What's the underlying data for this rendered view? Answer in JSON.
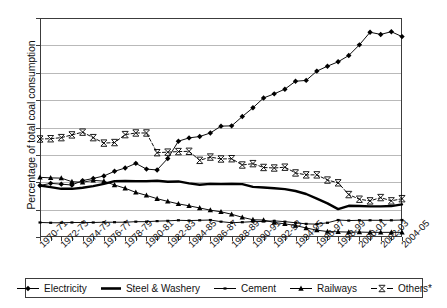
{
  "chart_data": {
    "type": "line",
    "title": "",
    "xlabel": "",
    "ylabel": "Percentage of total coal consumption",
    "ylim": [
      0,
      80
    ],
    "ytick_step": 10,
    "yticks": [
      "0",
      "10",
      "20",
      "30",
      "40",
      "50",
      "60",
      "70",
      "80"
    ],
    "grid": true,
    "legend_position": "bottom",
    "x": [
      "1970-71",
      "1971-72",
      "1972-73",
      "1973-74",
      "1974-75",
      "1975-76",
      "1976-77",
      "1977-78",
      "1978-79",
      "1979-80",
      "1980-81",
      "1981-82",
      "1982-83",
      "1983-84",
      "1984-85",
      "1985-86",
      "1986-87",
      "1987-88",
      "1988-89",
      "1989-90",
      "1990-91",
      "1991-92",
      "1992-93",
      "1993-94",
      "1994-95",
      "1995-96",
      "1996-97",
      "1997-98",
      "1998-99",
      "1999-00",
      "2000-01",
      "2001-02",
      "2002-03",
      "2003-04",
      "2004-05"
    ],
    "xtick_labels": [
      "1970-71",
      "1972-73",
      "1974-75",
      "1976-77",
      "1978-79",
      "1980-81",
      "1982-83",
      "1984-85",
      "1986-87",
      "1988-89",
      "1990-91",
      "1992-93",
      "1994-95",
      "1996-97",
      "1998-99",
      "2000-01",
      "2002-03",
      "2004-05"
    ],
    "series": [
      {
        "name": "Electricity",
        "marker": "diamond",
        "linestyle": "solid",
        "color": "#000000",
        "values": [
          18.8,
          19.6,
          19.3,
          19.0,
          20.6,
          21.4,
          22.3,
          24.0,
          25.2,
          26.9,
          24.8,
          24.5,
          28.7,
          35.0,
          36.2,
          36.7,
          38.0,
          40.5,
          40.6,
          44.0,
          47.2,
          50.8,
          52.3,
          54.0,
          56.9,
          57.2,
          60.6,
          62.4,
          64.0,
          66.3,
          70.2,
          74.8,
          74.0,
          75.0,
          73.2
        ]
      },
      {
        "name": "Steel & Washery",
        "marker": "none",
        "linestyle": "thick-solid",
        "color": "#000000",
        "values": [
          18.8,
          18.2,
          17.6,
          17.6,
          18.0,
          18.6,
          19.4,
          20.4,
          20.5,
          20.4,
          20.4,
          20.6,
          20.2,
          20.3,
          19.6,
          19.1,
          19.4,
          19.3,
          19.4,
          19.3,
          18.3,
          18.1,
          17.8,
          17.5,
          16.8,
          15.7,
          14.0,
          12.3,
          10.2,
          11.4,
          11.3,
          11.2,
          11.2,
          11.3,
          11.9
        ]
      },
      {
        "name": "Cement",
        "marker": "dash",
        "linestyle": "solid",
        "color": "#000000",
        "values": [
          5.3,
          5.2,
          5.2,
          5.3,
          5.3,
          5.3,
          5.4,
          5.4,
          5.4,
          5.6,
          5.6,
          5.8,
          5.9,
          6.1,
          6.0,
          6.1,
          6.2,
          5.6,
          5.2,
          5.4,
          5.6,
          5.7,
          5.9,
          5.6,
          5.2,
          4.8,
          4.7,
          5.2,
          6.2,
          6.0,
          6.1,
          6.1,
          6.1,
          6.1,
          6.2
        ]
      },
      {
        "name": "Railways",
        "marker": "triangle",
        "linestyle": "solid",
        "color": "#000000",
        "values": [
          21.8,
          21.6,
          21.5,
          20.2,
          20.0,
          20.7,
          20.4,
          19.0,
          17.8,
          16.3,
          15.2,
          14.0,
          13.0,
          12.1,
          11.4,
          10.6,
          9.8,
          9.2,
          8.3,
          7.2,
          6.3,
          6.2,
          5.3,
          4.8,
          4.2,
          3.3,
          2.5,
          2.0,
          1.9,
          1.8,
          1.8,
          1.7,
          1.7,
          1.7,
          1.7
        ]
      },
      {
        "name": "Others*",
        "marker": "x",
        "linestyle": "dashed",
        "color": "#000000",
        "values": [
          35.8,
          35.9,
          36.3,
          37.3,
          38.3,
          36.3,
          34.3,
          34.5,
          37.4,
          38.0,
          38.0,
          30.8,
          31.0,
          31.2,
          31.3,
          28.0,
          29.2,
          28.5,
          28.6,
          26.3,
          26.8,
          25.4,
          25.2,
          25.5,
          23.4,
          22.7,
          22.7,
          20.8,
          19.8,
          15.5,
          13.8,
          13.2,
          14.4,
          13.2,
          14.0
        ]
      }
    ]
  },
  "legend": {
    "items": [
      {
        "label": "Electricity",
        "marker": "diamond"
      },
      {
        "label": "Steel & Washery",
        "marker": "none"
      },
      {
        "label": "Cement",
        "marker": "dash"
      },
      {
        "label": "Railways",
        "marker": "triangle"
      },
      {
        "label": "Others*",
        "marker": "x"
      }
    ]
  }
}
